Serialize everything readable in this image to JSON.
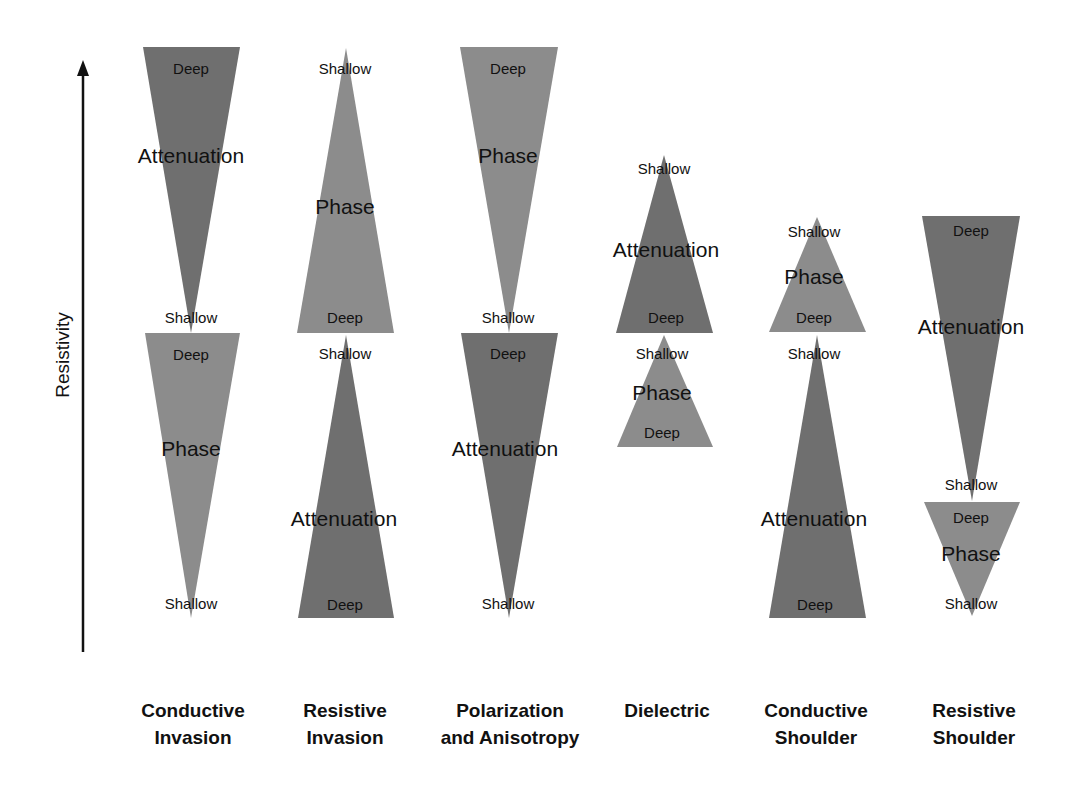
{
  "axis": {
    "label": "Resistivity"
  },
  "colors": {
    "attenuation": "#6f6f6f",
    "phase": "#8c8c8c",
    "text": "#111111"
  },
  "columns": [
    {
      "label_line1": "Conductive",
      "label_line2": "Invasion",
      "cx": 191
    },
    {
      "label_line1": "Resistive",
      "label_line2": "Invasion",
      "cx": 346
    },
    {
      "label_line1": "Polarization",
      "label_line2": "and Anisotropy",
      "cx": 509
    },
    {
      "label_line1": "Dielectric",
      "label_line2": "",
      "cx": 665
    },
    {
      "label_line1": "Conductive",
      "label_line2": "Shoulder",
      "cx": 817
    },
    {
      "label_line1": "Resistive",
      "label_line2": "Shoulder",
      "cx": 970
    }
  ],
  "triangles": {
    "c0_top": {
      "name": "Attenuation",
      "top": "Deep",
      "bottom": "Shallow"
    },
    "c0_bot": {
      "name": "Phase",
      "top": "Deep",
      "bottom": "Shallow"
    },
    "c1_top": {
      "name": "Phase",
      "top": "Shallow",
      "bottom": "Deep"
    },
    "c1_bot": {
      "name": "Attenuation",
      "top": "Shallow",
      "bottom": "Deep"
    },
    "c2_top": {
      "name": "Phase",
      "top": "Deep",
      "bottom": "Shallow"
    },
    "c2_bot": {
      "name": "Attenuation",
      "top": "Deep",
      "bottom": "Shallow"
    },
    "c3_top": {
      "name": "Attenuation",
      "top": "Shallow",
      "bottom": "Deep"
    },
    "c3_bot": {
      "name": "Phase",
      "top": "Shallow",
      "bottom": "Deep"
    },
    "c4_top": {
      "name": "Phase",
      "top": "Shallow",
      "bottom": "Deep"
    },
    "c4_bot": {
      "name": "Attenuation",
      "top": "Shallow",
      "bottom": "Deep"
    },
    "c5_top": {
      "name": "Attenuation",
      "top": "Deep",
      "bottom": "Shallow"
    },
    "c5_bot": {
      "name": "Phase",
      "top": "Deep",
      "bottom": "Shallow"
    }
  }
}
